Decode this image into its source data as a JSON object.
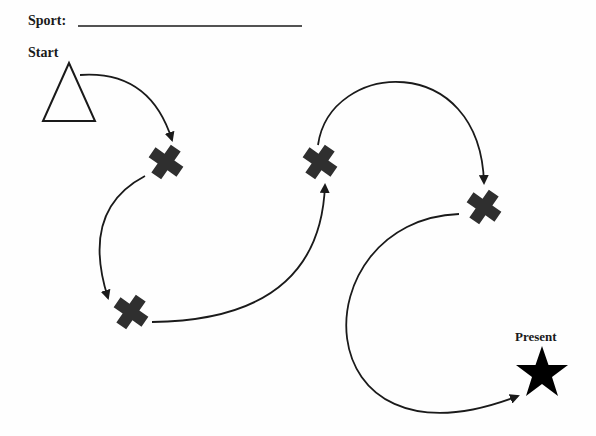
{
  "header": {
    "sport_label": "Sport:",
    "sport_value": ""
  },
  "start_label": "Start",
  "end_label": "Present",
  "nodes": [
    {
      "name": "start-triangle",
      "shape": "triangle"
    },
    {
      "name": "cross-1",
      "shape": "cross"
    },
    {
      "name": "cross-2",
      "shape": "cross"
    },
    {
      "name": "cross-3",
      "shape": "cross"
    },
    {
      "name": "cross-4",
      "shape": "cross"
    },
    {
      "name": "present-star",
      "shape": "star"
    }
  ],
  "colors": {
    "line": "#1a1a1a",
    "cross": "#2f2f2f",
    "star": "#000000"
  }
}
